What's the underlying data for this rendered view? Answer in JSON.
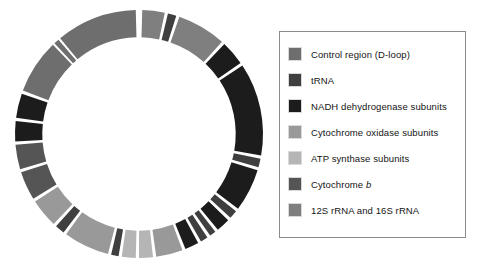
{
  "palette": {
    "control_region": "#6e6e6e",
    "trna": "#3f3f3f",
    "nadh": "#1c1c1c",
    "cytochrome_oxidase": "#999999",
    "atp_synthase": "#b5b5b5",
    "cytochrome_b": "#555555",
    "rrna": "#7f7f7f",
    "gap": "#ffffff",
    "legend_border": "#8b8b8b",
    "swatch_border": "#d9d9d9",
    "background": "#ffffff"
  },
  "legend": {
    "items": [
      {
        "label": "Control region (D-loop)",
        "key": "control_region",
        "swatch": "#6e6e6e",
        "italic_suffix": ""
      },
      {
        "label": "tRNA",
        "key": "trna",
        "swatch": "#3f3f3f",
        "italic_suffix": ""
      },
      {
        "label": "NADH dehydrogenase subunits",
        "key": "nadh",
        "swatch": "#1c1c1c",
        "italic_suffix": ""
      },
      {
        "label": "Cytochrome oxidase subunits",
        "key": "cytochrome_oxidase",
        "swatch": "#999999",
        "italic_suffix": ""
      },
      {
        "label": "ATP synthase subunits",
        "key": "atp_synthase",
        "swatch": "#b5b5b5",
        "italic_suffix": ""
      },
      {
        "label": "Cytochrome ",
        "key": "cytochrome_b",
        "swatch": "#555555",
        "italic_suffix": "b"
      },
      {
        "label": "12S rRNA and 16S rRNA",
        "key": "rrna",
        "swatch": "#7f7f7f",
        "italic_suffix": ""
      }
    ]
  },
  "chart_data": {
    "type": "pie",
    "subtype": "donut",
    "units": "degrees",
    "total_degrees": 360,
    "inner_radius_fraction": 0.78,
    "start_angle_deg": 0,
    "direction": "clockwise",
    "legend_position": "right",
    "grid": false,
    "categories": [
      "Control region (D-loop)",
      "tRNA",
      "NADH dehydrogenase subunits",
      "Cytochrome oxidase subunits",
      "ATP synthase subunits",
      "Cytochrome b",
      "12S rRNA and 16S rRNA",
      "gap"
    ],
    "category_colors": {
      "Control region (D-loop)": "#6e6e6e",
      "tRNA": "#3f3f3f",
      "NADH dehydrogenase subunits": "#1c1c1c",
      "Cytochrome oxidase subunits": "#999999",
      "ATP synthase subunits": "#b5b5b5",
      "Cytochrome b": "#555555",
      "12S rRNA and 16S rRNA": "#7f7f7f",
      "gap": "#ffffff"
    },
    "segments": [
      {
        "category": "12S rRNA and 16S rRNA",
        "start": 1.5,
        "end": 12.0
      },
      {
        "category": "gap",
        "start": 12.0,
        "end": 13.5
      },
      {
        "category": "tRNA",
        "start": 13.5,
        "end": 17.5
      },
      {
        "category": "gap",
        "start": 17.5,
        "end": 19.0
      },
      {
        "category": "12S rRNA and 16S rRNA",
        "start": 19.0,
        "end": 42.0
      },
      {
        "category": "gap",
        "start": 42.0,
        "end": 43.5
      },
      {
        "category": "NADH dehydrogenase subunits",
        "start": 43.5,
        "end": 55.0
      },
      {
        "category": "gap",
        "start": 55.0,
        "end": 56.5
      },
      {
        "category": "NADH dehydrogenase subunits",
        "start": 56.5,
        "end": 100.0
      },
      {
        "category": "gap",
        "start": 100.0,
        "end": 101.5
      },
      {
        "category": "tRNA",
        "start": 101.5,
        "end": 105.5
      },
      {
        "category": "gap",
        "start": 105.5,
        "end": 107.0
      },
      {
        "category": "NADH dehydrogenase subunits",
        "start": 107.0,
        "end": 127.0
      },
      {
        "category": "gap",
        "start": 127.0,
        "end": 128.5
      },
      {
        "category": "tRNA",
        "start": 128.5,
        "end": 132.5
      },
      {
        "category": "gap",
        "start": 132.5,
        "end": 134.0
      },
      {
        "category": "NADH dehydrogenase subunits",
        "start": 134.0,
        "end": 140.5
      },
      {
        "category": "gap",
        "start": 140.5,
        "end": 142.0
      },
      {
        "category": "tRNA",
        "start": 142.0,
        "end": 145.0
      },
      {
        "category": "gap",
        "start": 145.0,
        "end": 146.5
      },
      {
        "category": "tRNA",
        "start": 146.5,
        "end": 150.0
      },
      {
        "category": "gap",
        "start": 150.0,
        "end": 151.5
      },
      {
        "category": "NADH dehydrogenase subunits",
        "start": 151.5,
        "end": 158.0
      },
      {
        "category": "gap",
        "start": 158.0,
        "end": 159.5
      },
      {
        "category": "Cytochrome oxidase subunits",
        "start": 159.5,
        "end": 172.0
      },
      {
        "category": "gap",
        "start": 172.0,
        "end": 173.5
      },
      {
        "category": "ATP synthase subunits",
        "start": 173.5,
        "end": 180.0
      },
      {
        "category": "gap",
        "start": 180.0,
        "end": 181.5
      },
      {
        "category": "ATP synthase subunits",
        "start": 181.5,
        "end": 188.0
      },
      {
        "category": "gap",
        "start": 188.0,
        "end": 189.5
      },
      {
        "category": "tRNA",
        "start": 189.5,
        "end": 193.0
      },
      {
        "category": "gap",
        "start": 193.0,
        "end": 194.5
      },
      {
        "category": "Cytochrome oxidase subunits",
        "start": 194.5,
        "end": 216.0
      },
      {
        "category": "gap",
        "start": 216.0,
        "end": 217.5
      },
      {
        "category": "tRNA",
        "start": 217.5,
        "end": 222.0
      },
      {
        "category": "gap",
        "start": 222.0,
        "end": 223.5
      },
      {
        "category": "Cytochrome oxidase subunits",
        "start": 223.5,
        "end": 237.0
      },
      {
        "category": "gap",
        "start": 237.0,
        "end": 238.5
      },
      {
        "category": "Cytochrome b",
        "start": 238.5,
        "end": 252.0
      },
      {
        "category": "gap",
        "start": 252.0,
        "end": 253.5
      },
      {
        "category": "Cytochrome b",
        "start": 253.5,
        "end": 265.0
      },
      {
        "category": "gap",
        "start": 265.0,
        "end": 266.5
      },
      {
        "category": "NADH dehydrogenase subunits",
        "start": 266.5,
        "end": 276.0
      },
      {
        "category": "gap",
        "start": 276.0,
        "end": 277.5
      },
      {
        "category": "NADH dehydrogenase subunits",
        "start": 277.5,
        "end": 289.0
      },
      {
        "category": "gap",
        "start": 289.0,
        "end": 290.5
      },
      {
        "category": "Control region (D-loop)",
        "start": 290.5,
        "end": 316.0
      },
      {
        "category": "gap",
        "start": 316.0,
        "end": 317.0
      },
      {
        "category": "Control region (D-loop)",
        "start": 317.0,
        "end": 319.5
      },
      {
        "category": "gap",
        "start": 319.5,
        "end": 320.5
      },
      {
        "category": "Control region (D-loop)",
        "start": 320.5,
        "end": 358.5
      },
      {
        "category": "gap",
        "start": 358.5,
        "end": 361.5
      }
    ]
  }
}
